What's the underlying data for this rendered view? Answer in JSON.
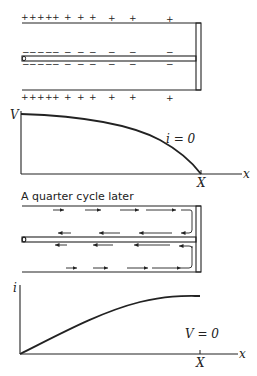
{
  "figure": {
    "panel1": {
      "name": "charge-distribution",
      "top_signs": [
        "+",
        "+",
        "+",
        "+",
        "+",
        "+",
        "+",
        "+",
        "+",
        "+",
        "+"
      ],
      "inner_top_signs": [
        "−",
        "−",
        "−",
        "−",
        "−",
        "−",
        "−",
        "−",
        "−",
        "−",
        "−"
      ],
      "inner_bottom_signs": [
        "−",
        "−",
        "−",
        "−",
        "−",
        "−",
        "−",
        "−",
        "−",
        "−",
        "−"
      ],
      "bottom_signs": [
        "+",
        "+",
        "+",
        "+",
        "+",
        "+",
        "+",
        "+",
        "+",
        "+",
        "+"
      ]
    },
    "panel2": {
      "name": "voltage-graph",
      "y_label": "V",
      "x_label": "x",
      "x_mark": "X",
      "annotation": "i = 0"
    },
    "panel3": {
      "name": "current-flow",
      "caption": "A quarter cycle later"
    },
    "panel4": {
      "name": "current-graph",
      "y_label": "i",
      "x_label": "x",
      "x_mark": "X",
      "annotation": "V = 0"
    }
  },
  "colors": {
    "ink": "#222222",
    "background": "#ffffff"
  }
}
